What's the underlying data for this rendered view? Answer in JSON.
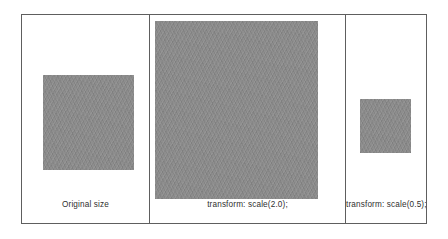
{
  "figure": {
    "name": "css-transform-scale-comparison",
    "border_color": "#5e5e5e",
    "background_color": "#ffffff",
    "swatch_color": "#8a8a8a",
    "caption_color": "#2f2f2f",
    "panels": [
      {
        "id": "original",
        "caption": "Original size",
        "swatch_label": "original-square",
        "scale": 1.0
      },
      {
        "id": "scale-up",
        "caption": "transform: scale(2.0);",
        "swatch_label": "scaled-up-square",
        "scale": 2.0
      },
      {
        "id": "scale-down",
        "caption": "transform: scale(0.5);",
        "swatch_label": "scaled-down-square",
        "scale": 0.5
      }
    ]
  }
}
